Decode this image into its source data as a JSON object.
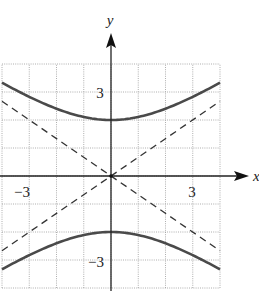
{
  "chart_data": {
    "type": "line",
    "title": "",
    "xlabel": "x",
    "ylabel": "y",
    "xlim": [
      -4,
      4
    ],
    "ylim": [
      -4,
      4
    ],
    "grid": true,
    "x_ticks_labeled": [
      {
        "value": -3,
        "label": "−3"
      },
      {
        "value": 3,
        "label": "3"
      }
    ],
    "y_ticks_labeled": [
      {
        "value": 3,
        "label": "3"
      },
      {
        "value": -3,
        "label": "−3"
      }
    ],
    "equation": "y^2/4 - x^2/9 = 1",
    "series": [
      {
        "name": "hyperbola upper branch",
        "style": "solid",
        "x": [
          -4,
          -3,
          -2,
          -1,
          0,
          1,
          2,
          3,
          4
        ],
        "y": [
          3.33,
          2.83,
          2.4,
          2.11,
          2.0,
          2.11,
          2.4,
          2.83,
          3.33
        ]
      },
      {
        "name": "hyperbola lower branch",
        "style": "solid",
        "x": [
          -4,
          -3,
          -2,
          -1,
          0,
          1,
          2,
          3,
          4
        ],
        "y": [
          -3.33,
          -2.83,
          -2.4,
          -2.11,
          -2.0,
          -2.11,
          -2.4,
          -2.83,
          -3.33
        ]
      },
      {
        "name": "asymptote y = (2/3)x",
        "style": "dashed",
        "x": [
          -4,
          4
        ],
        "y": [
          -2.67,
          2.67
        ]
      },
      {
        "name": "asymptote y = -(2/3)x",
        "style": "dashed",
        "x": [
          -4,
          4
        ],
        "y": [
          2.67,
          -2.67
        ]
      }
    ],
    "vertices": [
      [
        0,
        2
      ],
      [
        0,
        -2
      ]
    ]
  },
  "labels": {
    "x_axis": "x",
    "y_axis": "y",
    "x_neg3": "−3",
    "x_pos3": "3",
    "y_pos3": "3",
    "y_neg3": "−3"
  },
  "colors": {
    "curve": "#4a4a4a",
    "asymptote": "#333333",
    "grid": "#9a9a9a",
    "axis": "#222222"
  }
}
